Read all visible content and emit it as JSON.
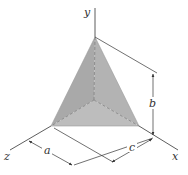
{
  "figure": {
    "type": "tetrahedron-dimension-diagram",
    "axes": {
      "x": "x",
      "y": "y",
      "z": "z"
    },
    "dimensions": {
      "a": "a",
      "b": "b",
      "c": "c"
    },
    "colors": {
      "face_fill": "#a9a9a9",
      "face_fill_light": "#bdbdbd",
      "line": "#333333",
      "hidden_line": "#777777",
      "background": "#ffffff"
    }
  }
}
